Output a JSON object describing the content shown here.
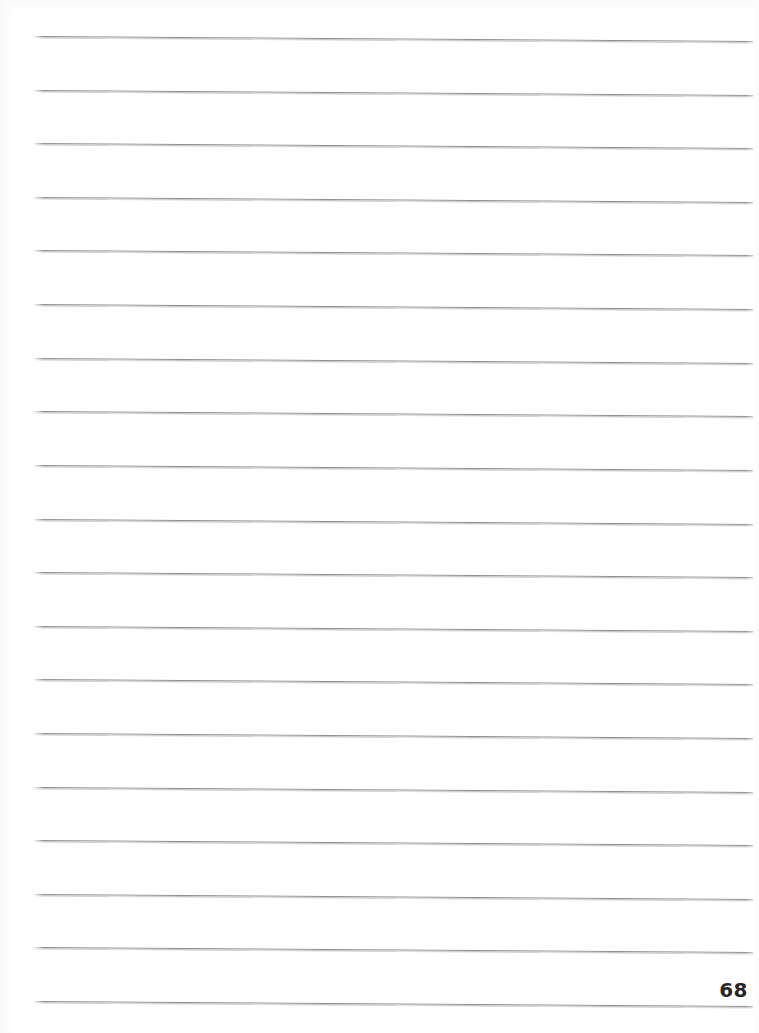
{
  "document": {
    "type": "scanned-lined-notebook-page",
    "page_number": "68",
    "background_color": "#ffffff",
    "rule_color": "#8e8e8e",
    "page_number_color": "#262626",
    "total_rule_lines": 19,
    "body_text": "",
    "notes": ""
  },
  "rules": {
    "left_x": 34,
    "right_x": 753,
    "first_line_y": 36,
    "line_spacing": 53.6,
    "skew_drop_px": 5,
    "lines": [
      {
        "index": 1,
        "y_left": 36,
        "y_right": 41
      },
      {
        "index": 2,
        "y_left": 90,
        "y_right": 95
      },
      {
        "index": 3,
        "y_left": 143,
        "y_right": 148
      },
      {
        "index": 4,
        "y_left": 197,
        "y_right": 202
      },
      {
        "index": 5,
        "y_left": 250,
        "y_right": 255
      },
      {
        "index": 6,
        "y_left": 304,
        "y_right": 309
      },
      {
        "index": 7,
        "y_left": 358,
        "y_right": 363
      },
      {
        "index": 8,
        "y_left": 411,
        "y_right": 416
      },
      {
        "index": 9,
        "y_left": 465,
        "y_right": 470
      },
      {
        "index": 10,
        "y_left": 519,
        "y_right": 524
      },
      {
        "index": 11,
        "y_left": 572,
        "y_right": 577
      },
      {
        "index": 12,
        "y_left": 626,
        "y_right": 631
      },
      {
        "index": 13,
        "y_left": 679,
        "y_right": 684
      },
      {
        "index": 14,
        "y_left": 733,
        "y_right": 738
      },
      {
        "index": 15,
        "y_left": 787,
        "y_right": 792
      },
      {
        "index": 16,
        "y_left": 840,
        "y_right": 845
      },
      {
        "index": 17,
        "y_left": 894,
        "y_right": 899
      },
      {
        "index": 18,
        "y_left": 947,
        "y_right": 952
      },
      {
        "index": 19,
        "y_left": 1001,
        "y_right": 1006
      }
    ]
  }
}
